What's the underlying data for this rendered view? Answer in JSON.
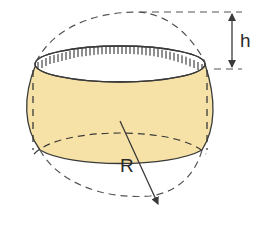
{
  "diagram": {
    "type": "geometry",
    "labels": {
      "height": "h",
      "radius": "R"
    },
    "colors": {
      "fill": "#f6e2a6",
      "stroke": "#3a3a3a",
      "dashed": "#555555",
      "background": "#ffffff"
    },
    "elements": [
      {
        "name": "sphere-outline",
        "style": "dashed circle"
      },
      {
        "name": "barrel-body",
        "style": "filled spherical zone"
      },
      {
        "name": "top-opening",
        "style": "ellipse with hatch marks"
      },
      {
        "name": "bottom-base",
        "style": "half-dashed ellipse"
      },
      {
        "name": "height-dimension",
        "label": "h",
        "style": "double arrow between dashed extension lines"
      },
      {
        "name": "radius-arrow",
        "label": "R",
        "style": "arrow from center to sphere surface"
      }
    ]
  }
}
